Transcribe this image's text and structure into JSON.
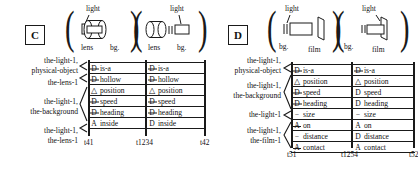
{
  "figure": {
    "panels": [
      {
        "id": "C",
        "letter": "C",
        "sketches": [
          {
            "name": "lens-light-overlap",
            "top_label": "light",
            "bottom_left_label": "lens",
            "bottom_right_label": "bg.",
            "icon": "lens-cylinder-overlapping-light-bar"
          },
          {
            "name": "lens-light-separate",
            "top_label": "light",
            "bottom_left_label": "lens",
            "bottom_right_label": "bg.",
            "icon": "lens-cylinder-apart-from-light-bar"
          }
        ],
        "row_labels": [
          {
            "lines": [
              "the-light-1,",
              "physical-object"
            ],
            "span": 1
          },
          {
            "lines": [
              "the-lens-1"
            ],
            "span": 1
          },
          {
            "lines": [
              "the-light-1,",
              "the-background"
            ],
            "span": 3
          },
          {
            "lines": [
              "the-light-1,",
              "the-lens-1"
            ],
            "span": 1
          }
        ],
        "rows": [
          {
            "left": {
              "symbol": "D-slash",
              "text": "is-a"
            },
            "right": {
              "symbol": "D-slash",
              "text": "is-a"
            }
          },
          {
            "left": {
              "symbol": "D-slash",
              "text": "hollow"
            },
            "right": {
              "symbol": "D-slash",
              "text": "hollow"
            }
          },
          {
            "left": {
              "symbol": "triangle",
              "text": "position"
            },
            "right": {
              "symbol": "triangle",
              "text": "position"
            }
          },
          {
            "left": {
              "symbol": "D-slash",
              "text": "speed"
            },
            "right": {
              "symbol": "D-slash",
              "text": "speed"
            }
          },
          {
            "left": {
              "symbol": "D-slash",
              "text": "heading"
            },
            "right": {
              "symbol": "D-slash",
              "text": "heading"
            }
          },
          {
            "left": {
              "symbol": "A",
              "text": "inside"
            },
            "right": {
              "symbol": "D",
              "text": "inside"
            }
          }
        ],
        "ticks": [
          "t41",
          "t1234",
          "t42"
        ]
      },
      {
        "id": "D",
        "letter": "D",
        "sketches": [
          {
            "name": "film-light-separate",
            "top_label": "light",
            "bottom_left_label": "bg.",
            "bottom_right_label": "film",
            "icon": "light-bar-apart-from-film-plane"
          },
          {
            "name": "film-light-contact",
            "top_label": "light",
            "bottom_left_label": "bg.",
            "bottom_right_label": "film",
            "icon": "light-bar-touching-film-plane"
          }
        ],
        "row_labels": [
          {
            "lines": [
              "the-light-1,",
              "physical-object"
            ],
            "span": 1
          },
          {
            "lines": [
              "the-light-1,",
              "the-background"
            ],
            "span": 3
          },
          {
            "lines": [
              "the-light-1"
            ],
            "span": 1
          },
          {
            "lines": [
              "the-light-1,",
              "the-film-1"
            ],
            "span": 3
          }
        ],
        "rows": [
          {
            "left": {
              "symbol": "D-slash",
              "text": "is-a"
            },
            "right": {
              "symbol": "D-slash",
              "text": "is-a"
            }
          },
          {
            "left": {
              "symbol": "triangle",
              "text": "position"
            },
            "right": {
              "symbol": "triangle",
              "text": "position"
            }
          },
          {
            "left": {
              "symbol": "D-slash",
              "text": "speed"
            },
            "right": {
              "symbol": "D",
              "text": "speed"
            }
          },
          {
            "left": {
              "symbol": "D-slash",
              "text": "heading"
            },
            "right": {
              "symbol": "D",
              "text": "heading"
            }
          },
          {
            "left": {
              "symbol": "dash",
              "text": "size"
            },
            "right": {
              "symbol": "dash",
              "text": "size"
            }
          },
          {
            "left": {
              "symbol": "A-slash",
              "text": "on"
            },
            "right": {
              "symbol": "A",
              "text": "on"
            }
          },
          {
            "left": {
              "symbol": "dash",
              "text": "distance"
            },
            "right": {
              "symbol": "D",
              "text": "distance"
            }
          },
          {
            "left": {
              "symbol": "A-slash",
              "text": "contact"
            },
            "right": {
              "symbol": "A",
              "text": "contact"
            }
          }
        ],
        "ticks": [
          "t51",
          "t1254",
          "t52"
        ]
      }
    ],
    "colors": {
      "ink": "#1a1a1a",
      "paper": "#ffffff"
    }
  }
}
